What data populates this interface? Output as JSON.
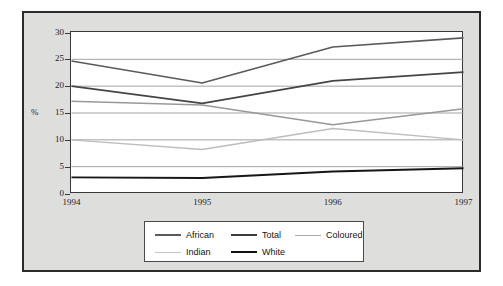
{
  "chart_data": {
    "type": "line",
    "title": "",
    "subtitle": "",
    "xlabel": "",
    "ylabel": "%",
    "categories": [
      "1994",
      "1995",
      "1996",
      "1997"
    ],
    "x": [
      1994,
      1995,
      1996,
      1997
    ],
    "xlim": [
      1994,
      1997
    ],
    "ylim": [
      0,
      30
    ],
    "yticks": [
      0,
      5,
      10,
      15,
      20,
      25,
      30
    ],
    "ytick_labels": [
      "0",
      "5",
      "10",
      "15",
      "20",
      "25",
      "30"
    ],
    "xtick_labels": [
      "1994",
      "1995",
      "1996",
      "1997"
    ],
    "grid": true,
    "grid_axis": "y",
    "legend_position": "bottom",
    "series": [
      {
        "name": "African",
        "values": [
          24.7,
          20.6,
          27.3,
          29.0
        ],
        "color": "#5a5a5a",
        "width": 1.6
      },
      {
        "name": "Total",
        "values": [
          20.0,
          16.8,
          21.0,
          22.6
        ],
        "color": "#454545",
        "width": 1.7
      },
      {
        "name": "Coloured",
        "values": [
          17.2,
          16.5,
          12.8,
          15.8
        ],
        "color": "#989898",
        "width": 1.4
      },
      {
        "name": "Indian",
        "values": [
          10.0,
          8.2,
          12.1,
          10.0
        ],
        "color": "#bdbdbd",
        "width": 1.4
      },
      {
        "name": "White",
        "values": [
          3.0,
          2.9,
          4.1,
          4.7
        ],
        "color": "#161616",
        "width": 1.9
      }
    ]
  },
  "legend": {
    "entries": [
      {
        "label": "African",
        "color": "#5a5a5a",
        "width": 2.0
      },
      {
        "label": "Total",
        "color": "#3c3c3c",
        "width": 2.2
      },
      {
        "label": "Coloured",
        "color": "#a8a8a8",
        "width": 1.6
      },
      {
        "label": "Indian",
        "color": "#c4c4c4",
        "width": 1.6
      },
      {
        "label": "White",
        "color": "#111111",
        "width": 2.4
      }
    ]
  },
  "colors": {
    "page_background": "#ffffff",
    "panel_background": "#dededd",
    "panel_border": "#2b2b2b",
    "plot_background": "#ffffff",
    "axis": "#39393b",
    "grid": "#9a9a9a",
    "text": "#1d1d1d",
    "legend_border": "#4a4a4a"
  }
}
